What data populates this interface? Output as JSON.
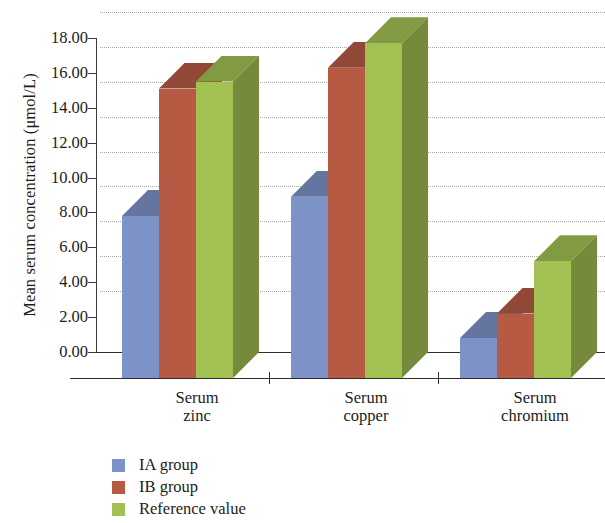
{
  "chart_data": {
    "type": "bar",
    "title": "",
    "subtitle": "",
    "xlabel": "",
    "ylabel": "Mean serum concentration (μmol/L)",
    "categories": [
      "Serum\nzinc",
      "Serum\ncopper",
      "Serum\nchromium"
    ],
    "series": [
      {
        "name": "IA group",
        "color": "#7d93c8",
        "values": [
          7.8,
          8.9,
          0.8
        ]
      },
      {
        "name": "IB group",
        "color": "#b65a44",
        "values": [
          15.1,
          16.3,
          2.2
        ]
      },
      {
        "name": "Reference value",
        "color": "#a2c152",
        "values": [
          15.5,
          17.7,
          5.2
        ]
      }
    ],
    "ylim": [
      0.0,
      18.0
    ],
    "ytick_step": 2.0,
    "ytick_labels": [
      "18.00",
      "16.00",
      "14.00",
      "12.00",
      "10.00",
      "8.00",
      "6.00",
      "4.00",
      "2.00",
      "0.00"
    ],
    "ytick_values": [
      18.0,
      16.0,
      14.0,
      12.0,
      10.0,
      8.0,
      6.0,
      4.0,
      2.0,
      0.0
    ],
    "grid": "horizontal-dotted",
    "legend_position": "bottom-left",
    "style_3d": true
  },
  "legend": {
    "items": [
      {
        "label": "IA group",
        "color": "#7d93c8"
      },
      {
        "label": "IB group",
        "color": "#b65a44"
      },
      {
        "label": "Reference value",
        "color": "#a2c152"
      }
    ]
  }
}
